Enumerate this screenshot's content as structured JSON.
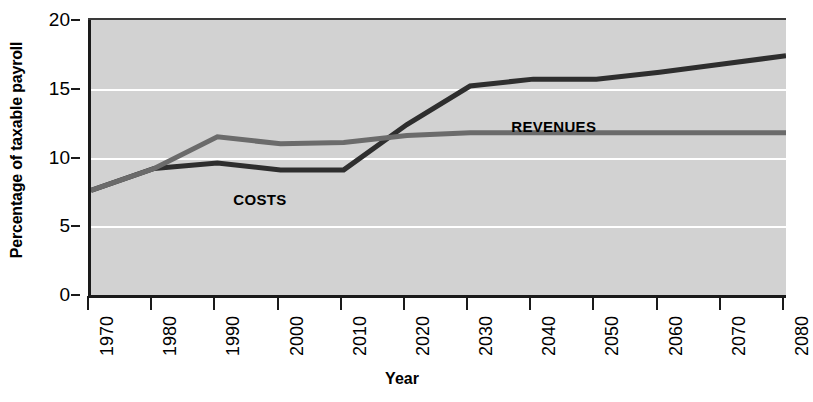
{
  "chart_data": {
    "type": "line",
    "title": "",
    "xlabel": "Year",
    "ylabel": "Percentage of taxable payroll",
    "xlim": [
      1970,
      2080
    ],
    "ylim": [
      0,
      20
    ],
    "grid": true,
    "legend_position": "inline-annotation",
    "x_ticks": [
      "1970",
      "1980",
      "1990",
      "2000",
      "2010",
      "2020",
      "2030",
      "2040",
      "2050",
      "2060",
      "2070",
      "2080"
    ],
    "y_ticks": [
      "0",
      "5",
      "10",
      "15",
      "20"
    ],
    "x": [
      1970,
      1980,
      1990,
      2000,
      2010,
      2020,
      2030,
      2040,
      2050,
      2060,
      2070,
      2080
    ],
    "series": [
      {
        "name": "COSTS",
        "color": "#2e2e2e",
        "label_x": 1993,
        "label_y": 7.6,
        "values": [
          7.6,
          9.2,
          9.6,
          9.1,
          9.1,
          12.4,
          15.2,
          15.7,
          15.7,
          16.2,
          16.8,
          17.4
        ]
      },
      {
        "name": "REVENUES",
        "color": "#6b6b6b",
        "label_x": 2037,
        "label_y": 12.9,
        "values": [
          7.6,
          9.2,
          11.5,
          11.0,
          11.1,
          11.6,
          11.8,
          11.8,
          11.8,
          11.8,
          11.8,
          11.8
        ]
      }
    ]
  },
  "colors": {
    "plot_background": "#d2d2d2",
    "gridline": "#ffffff",
    "axis": "#1a1a1a",
    "page_background": "#ffffff",
    "costs_line": "#2e2e2e",
    "revenues_line": "#6b6b6b"
  }
}
